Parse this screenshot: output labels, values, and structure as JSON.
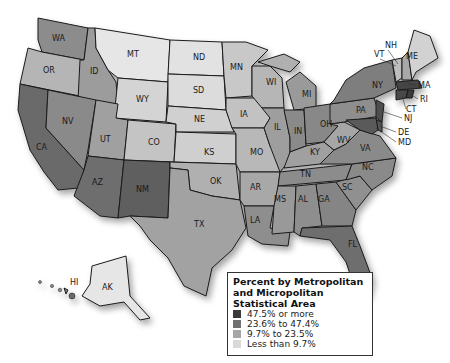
{
  "legend": {
    "title_lines": [
      "Percent by Metropolitan",
      "and Micropolitan",
      "Statistical Area"
    ],
    "items": [
      {
        "label": "47.5% or more",
        "color": "#3a3a3a"
      },
      {
        "label": "23.6% to 47.4%",
        "color": "#707070"
      },
      {
        "label": "9.7% to 23.5%",
        "color": "#a6a6a6"
      },
      {
        "label": "Less than 9.7%",
        "color": "#d9d9d9"
      }
    ]
  },
  "states": {
    "WA": "WA",
    "OR": "OR",
    "CA": "CA",
    "ID": "ID",
    "NV": "NV",
    "MT": "MT",
    "WY": "WY",
    "UT": "UT",
    "AZ": "AZ",
    "CO": "CO",
    "NM": "NM",
    "ND": "ND",
    "SD": "SD",
    "NE": "NE",
    "KS": "KS",
    "OK": "OK",
    "TX": "TX",
    "MN": "MN",
    "IA": "IA",
    "MO": "MO",
    "AR": "AR",
    "LA": "LA",
    "WI": "WI",
    "IL": "IL",
    "MI": "MI",
    "IN": "IN",
    "OH": "OH",
    "KY": "KY",
    "TN": "TN",
    "MS": "MS",
    "AL": "AL",
    "GA": "GA",
    "FL": "FL",
    "SC": "SC",
    "NC": "NC",
    "VA": "VA",
    "WV": "WV",
    "PA": "PA",
    "NY": "NY",
    "VT": "VT",
    "NH": "NH",
    "ME": "ME",
    "MA": "MA",
    "RI": "RI",
    "CT": "CT",
    "NJ": "NJ",
    "DE": "DE",
    "MD": "MD",
    "HI": "HI",
    "AK": "AK"
  }
}
